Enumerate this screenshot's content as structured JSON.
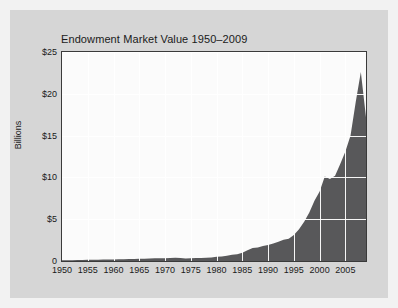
{
  "figure": {
    "title": "Endowment Market Value 1950–2009",
    "background_color": "#d6d6d6",
    "plot_background_color": "#fbfbfb",
    "area_fill_color": "#58585a",
    "gridline_color": "#ffffff",
    "axis_color": "#3a3a3a"
  },
  "chart_data": {
    "type": "area",
    "title": "Endowment Market Value 1950–2009",
    "xlabel": "",
    "ylabel": "Billions",
    "xlim": [
      1950,
      2009
    ],
    "ylim": [
      0,
      25
    ],
    "grid": true,
    "legend": "none",
    "ytick_labels": [
      "0",
      "$5",
      "$10",
      "$15",
      "$20",
      "$25"
    ],
    "ytick_values": [
      0,
      5,
      10,
      15,
      20,
      25
    ],
    "xtick_labels": [
      "1950",
      "1955",
      "1960",
      "1965",
      "1970",
      "1975",
      "1980",
      "1985",
      "1990",
      "1995",
      "2000",
      "2005"
    ],
    "xtick_values": [
      1950,
      1955,
      1960,
      1965,
      1970,
      1975,
      1980,
      1985,
      1990,
      1995,
      2000,
      2005
    ],
    "x": [
      1950,
      1951,
      1952,
      1953,
      1954,
      1955,
      1956,
      1957,
      1958,
      1959,
      1960,
      1961,
      1962,
      1963,
      1964,
      1965,
      1966,
      1967,
      1968,
      1969,
      1970,
      1971,
      1972,
      1973,
      1974,
      1975,
      1976,
      1977,
      1978,
      1979,
      1980,
      1981,
      1982,
      1983,
      1984,
      1985,
      1986,
      1987,
      1988,
      1989,
      1990,
      1991,
      1992,
      1993,
      1994,
      1995,
      1996,
      1997,
      1998,
      1999,
      2000,
      2001,
      2002,
      2003,
      2004,
      2005,
      2006,
      2007,
      2008,
      2009
    ],
    "values": [
      0.08,
      0.09,
      0.1,
      0.11,
      0.12,
      0.14,
      0.15,
      0.15,
      0.17,
      0.18,
      0.19,
      0.21,
      0.21,
      0.23,
      0.25,
      0.27,
      0.28,
      0.31,
      0.34,
      0.33,
      0.32,
      0.35,
      0.38,
      0.36,
      0.31,
      0.33,
      0.36,
      0.37,
      0.39,
      0.43,
      0.5,
      0.55,
      0.62,
      0.75,
      0.8,
      1.0,
      1.3,
      1.55,
      1.6,
      1.8,
      1.9,
      2.1,
      2.3,
      2.55,
      2.65,
      3.1,
      3.8,
      4.7,
      5.8,
      7.2,
      8.3,
      10.1,
      9.8,
      10.2,
      11.6,
      13.1,
      15.0,
      19.0,
      22.6,
      17.2
    ],
    "series_name": "Endowment Market Value",
    "units": "Billions of dollars"
  }
}
